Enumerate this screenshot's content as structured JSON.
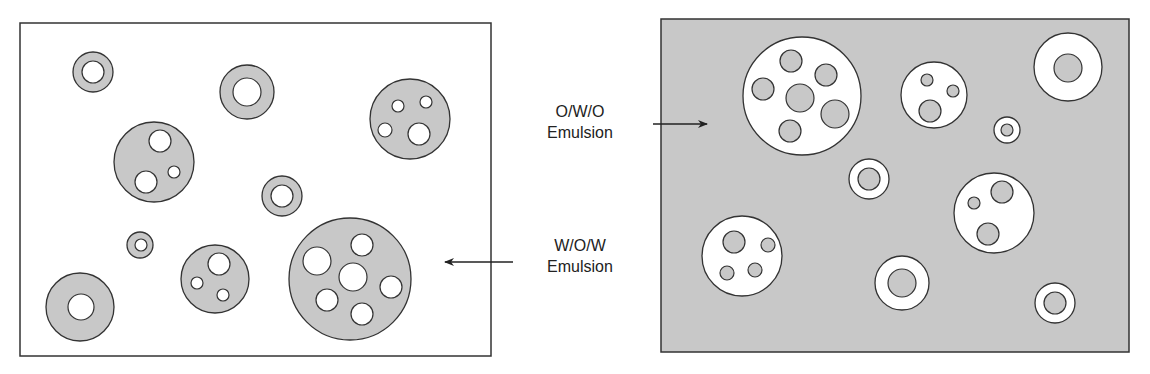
{
  "labels": {
    "owo_line1": "O/W/O",
    "owo_line2": "Emulsion",
    "wow_line1": "W/O/W",
    "wow_line2": "Emulsion"
  },
  "colors": {
    "oil_gray": "#c8c8c8",
    "water_white": "#ffffff",
    "stroke": "#333333"
  },
  "panels": {
    "wow": {
      "x": 20,
      "y": 23,
      "w": 471,
      "h": 333,
      "background": "#ffffff",
      "globule_fill": "#c8c8c8",
      "inner_fill": "#ffffff",
      "globules": [
        {
          "cx": 93,
          "cy": 72,
          "r": 20,
          "inner": [
            [
              93,
              72,
              11
            ]
          ]
        },
        {
          "cx": 247,
          "cy": 92,
          "r": 27,
          "inner": [
            [
              247,
              92,
              14
            ]
          ]
        },
        {
          "cx": 154,
          "cy": 162,
          "r": 40,
          "inner": [
            [
              160,
              141,
              11
            ],
            [
              146,
              182,
              11
            ],
            [
              174,
              172,
              6
            ]
          ]
        },
        {
          "cx": 410,
          "cy": 119,
          "r": 40,
          "inner": [
            [
              398,
              106,
              6
            ],
            [
              426,
              102,
              6
            ],
            [
              385,
              130,
              7
            ],
            [
              419,
              134,
              11
            ]
          ]
        },
        {
          "cx": 282,
          "cy": 196,
          "r": 20,
          "inner": [
            [
              282,
              196,
              11
            ]
          ]
        },
        {
          "cx": 140,
          "cy": 245,
          "r": 13,
          "inner": [
            [
              141,
              245,
              6
            ]
          ]
        },
        {
          "cx": 215,
          "cy": 279,
          "r": 34,
          "inner": [
            [
              219,
              264,
              11
            ],
            [
              197,
              283,
              6
            ],
            [
              223,
              295,
              6
            ]
          ]
        },
        {
          "cx": 350,
          "cy": 279,
          "r": 61,
          "inner": [
            [
              317,
              261,
              14
            ],
            [
              362,
              245,
              11
            ],
            [
              353,
              277,
              14
            ],
            [
              391,
              287,
              11
            ],
            [
              327,
              300,
              11
            ],
            [
              362,
              314,
              11
            ]
          ]
        },
        {
          "cx": 80,
          "cy": 307,
          "r": 34,
          "inner": [
            [
              81,
              307,
              13
            ]
          ]
        }
      ]
    },
    "owo": {
      "x": 661,
      "y": 19,
      "w": 468,
      "h": 333,
      "background": "#c8c8c8",
      "globule_fill": "#ffffff",
      "inner_fill": "#c8c8c8",
      "globules": [
        {
          "cx": 802,
          "cy": 96,
          "r": 59,
          "inner": [
            [
              791,
              61,
              11
            ],
            [
              826,
              75,
              11
            ],
            [
              763,
              89,
              11
            ],
            [
              800,
              98,
              14
            ],
            [
              835,
              114,
              14
            ],
            [
              790,
              131,
              11
            ]
          ]
        },
        {
          "cx": 934,
          "cy": 95,
          "r": 33,
          "inner": [
            [
              927,
              80,
              6
            ],
            [
              953,
              91,
              6
            ],
            [
              930,
              111,
              11
            ]
          ]
        },
        {
          "cx": 1068,
          "cy": 67,
          "r": 34,
          "inner": [
            [
              1068,
              68,
              14
            ]
          ]
        },
        {
          "cx": 1007,
          "cy": 130,
          "r": 13,
          "inner": [
            [
              1007,
              130,
              6
            ]
          ]
        },
        {
          "cx": 869,
          "cy": 179,
          "r": 20,
          "inner": [
            [
              869,
              179,
              11
            ]
          ]
        },
        {
          "cx": 994,
          "cy": 213,
          "r": 40,
          "inner": [
            [
              974,
              203,
              6
            ],
            [
              1002,
              192,
              11
            ],
            [
              988,
              234,
              11
            ]
          ]
        },
        {
          "cx": 742,
          "cy": 256,
          "r": 40,
          "inner": [
            [
              734,
              242,
              11
            ],
            [
              768,
              245,
              7
            ],
            [
              727,
              273,
              7
            ],
            [
              755,
              270,
              7
            ]
          ]
        },
        {
          "cx": 902,
          "cy": 283,
          "r": 27,
          "inner": [
            [
              902,
              283,
              14
            ]
          ]
        },
        {
          "cx": 1055,
          "cy": 303,
          "r": 20,
          "inner": [
            [
              1055,
              303,
              11
            ]
          ]
        }
      ]
    }
  },
  "arrows": [
    {
      "name": "owo-arrow",
      "x1": 653,
      "y1": 124,
      "x2": 707,
      "y2": 124
    },
    {
      "name": "wow-arrow",
      "x1": 513,
      "y1": 262,
      "x2": 445,
      "y2": 262
    }
  ]
}
